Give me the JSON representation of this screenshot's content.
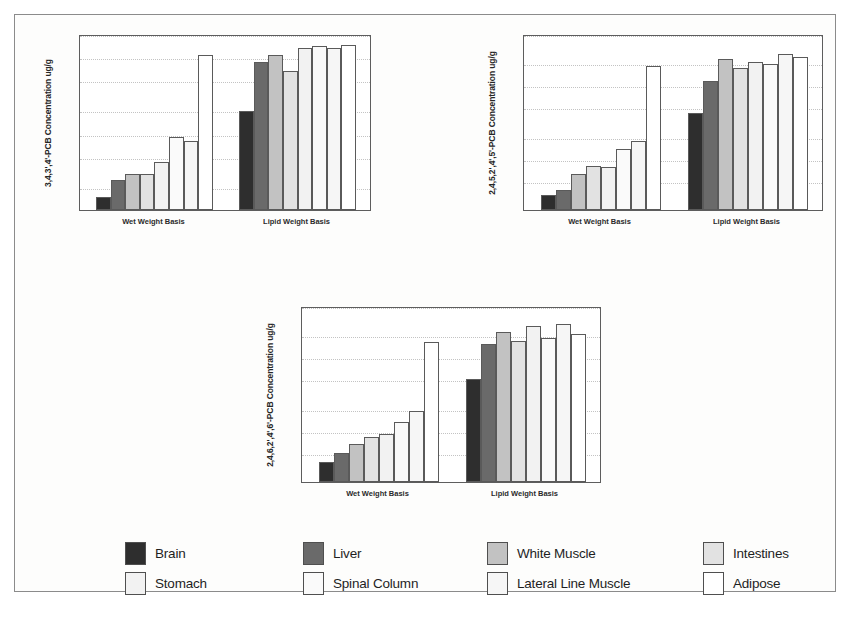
{
  "figure": {
    "panels_count": 3,
    "background": "#fdfdfc",
    "frame_color": "#8b8b8b"
  },
  "groups": {
    "wet": "Wet Weight Basis",
    "lipid": "Lipid Weight Basis"
  },
  "legend": {
    "items": [
      {
        "label": "Brain",
        "color": "#2e2e2e",
        "texture": "solid"
      },
      {
        "label": "Liver",
        "color": "#6a6a6a",
        "texture": "vline"
      },
      {
        "label": "White Muscle",
        "color": "#c2c2c2",
        "texture": "solid"
      },
      {
        "label": "Intestines",
        "color": "#e2e2e2",
        "texture": "solid"
      },
      {
        "label": "Stomach",
        "color": "#f2f2f2",
        "texture": "dots"
      },
      {
        "label": "Spinal Column",
        "color": "#fafafa",
        "texture": "solid"
      },
      {
        "label": "Lateral Line Muscle",
        "color": "#f6f6f6",
        "texture": "dots"
      },
      {
        "label": "Adipose",
        "color": "#ffffff",
        "texture": "solid"
      }
    ]
  },
  "chart_data": [
    {
      "id": "panel-1",
      "type": "bar",
      "title": "",
      "xlabel": "",
      "ylabel": "3,4,3',4'-PCB Concentration ug/g",
      "yscale": "log",
      "ylim": [
        0.1,
        20
      ],
      "yticks": [
        0.1,
        0.2,
        0.5,
        1,
        2,
        5,
        10,
        20
      ],
      "ytick_labels": [
        "0.1",
        "0.2",
        "0.5",
        "1",
        "2",
        "5",
        "10",
        "20"
      ],
      "grid": true,
      "legend_position": "below-figure",
      "categories": [
        "Wet Weight Basis",
        "Lipid Weight Basis"
      ],
      "series": [
        {
          "name": "Brain",
          "values": [
            0.15,
            2.0
          ]
        },
        {
          "name": "Liver",
          "values": [
            0.25,
            8.5
          ]
        },
        {
          "name": "White Muscle",
          "values": [
            0.3,
            10.5
          ]
        },
        {
          "name": "Intestines",
          "values": [
            0.3,
            6.5
          ]
        },
        {
          "name": "Stomach",
          "values": [
            0.43,
            13.0
          ]
        },
        {
          "name": "Spinal Column",
          "values": [
            0.9,
            14.0
          ]
        },
        {
          "name": "Lateral Line Muscle",
          "values": [
            0.8,
            13.2
          ]
        },
        {
          "name": "Adipose",
          "values": [
            10.5,
            14.5
          ]
        }
      ]
    },
    {
      "id": "panel-2",
      "type": "bar",
      "title": "",
      "xlabel": "",
      "ylabel": "2,4,5,2',4',5'-PCB Concentration ug/g",
      "yscale": "log",
      "ylim": [
        0.2,
        50
      ],
      "yticks": [
        0.2,
        0.5,
        1,
        2,
        5,
        10,
        20,
        50
      ],
      "ytick_labels": [
        "0.2",
        "0.5",
        "1",
        "2",
        "5",
        "10",
        "20",
        "50"
      ],
      "grid": true,
      "legend_position": "below-figure",
      "categories": [
        "Wet Weight Basis",
        "Lipid Weight Basis"
      ],
      "series": [
        {
          "name": "Brain",
          "values": [
            0.32,
            4.2
          ]
        },
        {
          "name": "Liver",
          "values": [
            0.38,
            11.5
          ]
        },
        {
          "name": "White Muscle",
          "values": [
            0.62,
            23.0
          ]
        },
        {
          "name": "Intestines",
          "values": [
            0.8,
            17.0
          ]
        },
        {
          "name": "Stomach",
          "values": [
            0.78,
            21.0
          ]
        },
        {
          "name": "Spinal Column",
          "values": [
            1.35,
            19.5
          ]
        },
        {
          "name": "Lateral Line Muscle",
          "values": [
            1.75,
            27.0
          ]
        },
        {
          "name": "Adipose",
          "values": [
            18.5,
            24.0
          ]
        }
      ]
    },
    {
      "id": "panel-3",
      "type": "bar",
      "title": "",
      "xlabel": "",
      "ylabel": "2,4,6,2',4',6'-PCB Concentration ug/g",
      "yscale": "log",
      "ylim": [
        0.2,
        50
      ],
      "yticks": [
        0.2,
        0.5,
        1,
        2,
        5,
        10,
        20,
        50
      ],
      "ytick_labels": [
        "0.2",
        "0.5",
        "1",
        "2",
        "5",
        "10",
        "20",
        "50"
      ],
      "grid": true,
      "legend_position": "below-figure",
      "categories": [
        "Wet Weight Basis",
        "Lipid Weight Basis"
      ],
      "series": [
        {
          "name": "Brain",
          "values": [
            0.38,
            5.0
          ]
        },
        {
          "name": "Liver",
          "values": [
            0.5,
            15.0
          ]
        },
        {
          "name": "White Muscle",
          "values": [
            0.65,
            22.0
          ]
        },
        {
          "name": "Intestines",
          "values": [
            0.82,
            16.5
          ]
        },
        {
          "name": "Stomach",
          "values": [
            0.9,
            27.0
          ]
        },
        {
          "name": "Spinal Column",
          "values": [
            1.3,
            18.5
          ]
        },
        {
          "name": "Lateral Line Muscle",
          "values": [
            1.85,
            28.0
          ]
        },
        {
          "name": "Adipose",
          "values": [
            16.0,
            21.0
          ]
        }
      ]
    }
  ]
}
